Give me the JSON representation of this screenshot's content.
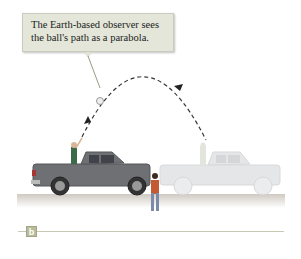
{
  "callout": {
    "text": "The Earth-based observer sees the ball's path as a parabola."
  },
  "panel": {
    "label": "b"
  },
  "scene": {
    "path_type": "parabola",
    "path_style": "dashed",
    "objects": [
      "truck-moving",
      "truck-ghost",
      "thrower",
      "ball",
      "ground-observer"
    ],
    "colors": {
      "truck": "#6f7073",
      "truck_ghost": "#dcdddf",
      "ground": "#d9d4cc",
      "callout_bg": "#e3e6d8",
      "path": "#333333"
    }
  }
}
